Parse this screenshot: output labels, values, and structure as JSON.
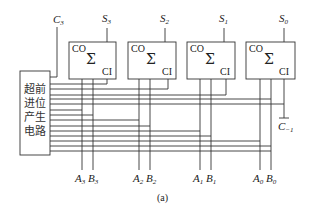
{
  "diagram": {
    "type": "carry-lookahead-adder",
    "caption": "(a)",
    "carry_lookahead_block": {
      "label_lines": [
        "超前",
        "进位",
        "产生",
        "电路"
      ]
    },
    "carry_out": {
      "name": "C",
      "sub": "3"
    },
    "carry_in": {
      "name": "C",
      "sub": "−1",
      "overline": true
    },
    "adders": [
      {
        "index": 3,
        "sum": {
          "name": "S",
          "sub": "3"
        },
        "co": "CO",
        "sigma": "Σ",
        "ci": "CI",
        "a": {
          "name": "A",
          "sub": "3"
        },
        "b": {
          "name": "B",
          "sub": "3"
        }
      },
      {
        "index": 2,
        "sum": {
          "name": "S",
          "sub": "2"
        },
        "co": "CO",
        "sigma": "Σ",
        "ci": "CI",
        "a": {
          "name": "A",
          "sub": "2"
        },
        "b": {
          "name": "B",
          "sub": "2"
        }
      },
      {
        "index": 1,
        "sum": {
          "name": "S",
          "sub": "1"
        },
        "co": "CO",
        "sigma": "Σ",
        "ci": "CI",
        "a": {
          "name": "A",
          "sub": "1"
        },
        "b": {
          "name": "B",
          "sub": "1"
        }
      },
      {
        "index": 0,
        "sum": {
          "name": "S",
          "sub": "0"
        },
        "co": "CO",
        "sigma": "Σ",
        "ci": "CI",
        "a": {
          "name": "A",
          "sub": "0"
        },
        "b": {
          "name": "B",
          "sub": "0"
        }
      }
    ]
  }
}
